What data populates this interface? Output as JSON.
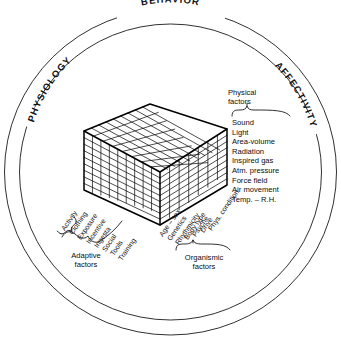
{
  "figure": {
    "title_ring": {
      "top": "BEHAVIOR",
      "left": "PHYSIOLOGY",
      "right": "AFFECTIVITY"
    }
  },
  "groups": {
    "physical": {
      "caption_line1": "Physical",
      "caption_line2": "factors",
      "items": [
        "Sound",
        "Light",
        "Area-volume",
        "Radiation",
        "Inspired gas",
        "Atm. pressure",
        "Force field",
        "Air movement",
        "Temp. – R.H."
      ]
    },
    "adaptive": {
      "caption_line1": "Adaptive",
      "caption_line2": "factors",
      "items": [
        "Activity",
        "Clothing",
        "Exposure",
        "Incentive",
        "Ingesta",
        "Social",
        "Tools",
        "Training"
      ]
    },
    "organismic": {
      "caption_line1": "Organismic",
      "caption_line2": "factors",
      "items": [
        "Age – sex",
        "Genetics",
        "Rhythmicity",
        "Body type",
        "Psyche",
        "Drive",
        "Phys. condition"
      ]
    }
  },
  "colors": {
    "ink": "#111111",
    "background": "#ffffff",
    "cube_top": "#ffffff",
    "cube_left": "#ffffff",
    "cube_right": "#ffffff"
  }
}
